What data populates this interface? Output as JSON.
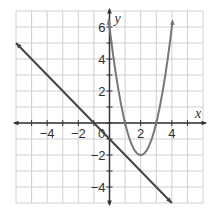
{
  "chart_data": {
    "type": "line",
    "title": "",
    "xlabel": "x",
    "ylabel": "y",
    "xlim": [
      -6,
      6
    ],
    "ylim": [
      -5,
      7
    ],
    "grid": true,
    "x_ticks": [
      -4,
      -2,
      0,
      2,
      4
    ],
    "y_ticks": [
      -4,
      -2,
      2,
      4,
      6
    ],
    "x_tick_labels": [
      "−4",
      "−2",
      "0",
      "2",
      "4"
    ],
    "y_tick_labels": [
      "−4",
      "−2",
      "2",
      "4",
      "6"
    ],
    "series": [
      {
        "name": "line",
        "equation": "y = -x - 1",
        "x": [
          -6,
          4
        ],
        "y": [
          5,
          -5
        ],
        "arrows": "both"
      },
      {
        "name": "parabola",
        "equation": "y = 2(x-2)^2 - 2",
        "vertex": [
          2,
          -2
        ],
        "roots": [
          1,
          3
        ],
        "x": [
          -0.06,
          0,
          1,
          2,
          3,
          4,
          4.06
        ],
        "y": [
          6.5,
          6,
          0,
          -2,
          0,
          6,
          6.5
        ],
        "arrows": "both"
      }
    ],
    "colors": {
      "grid": "#cfcfcf",
      "axis": "#333333",
      "line": "#444444",
      "parabola": "#777777"
    }
  }
}
